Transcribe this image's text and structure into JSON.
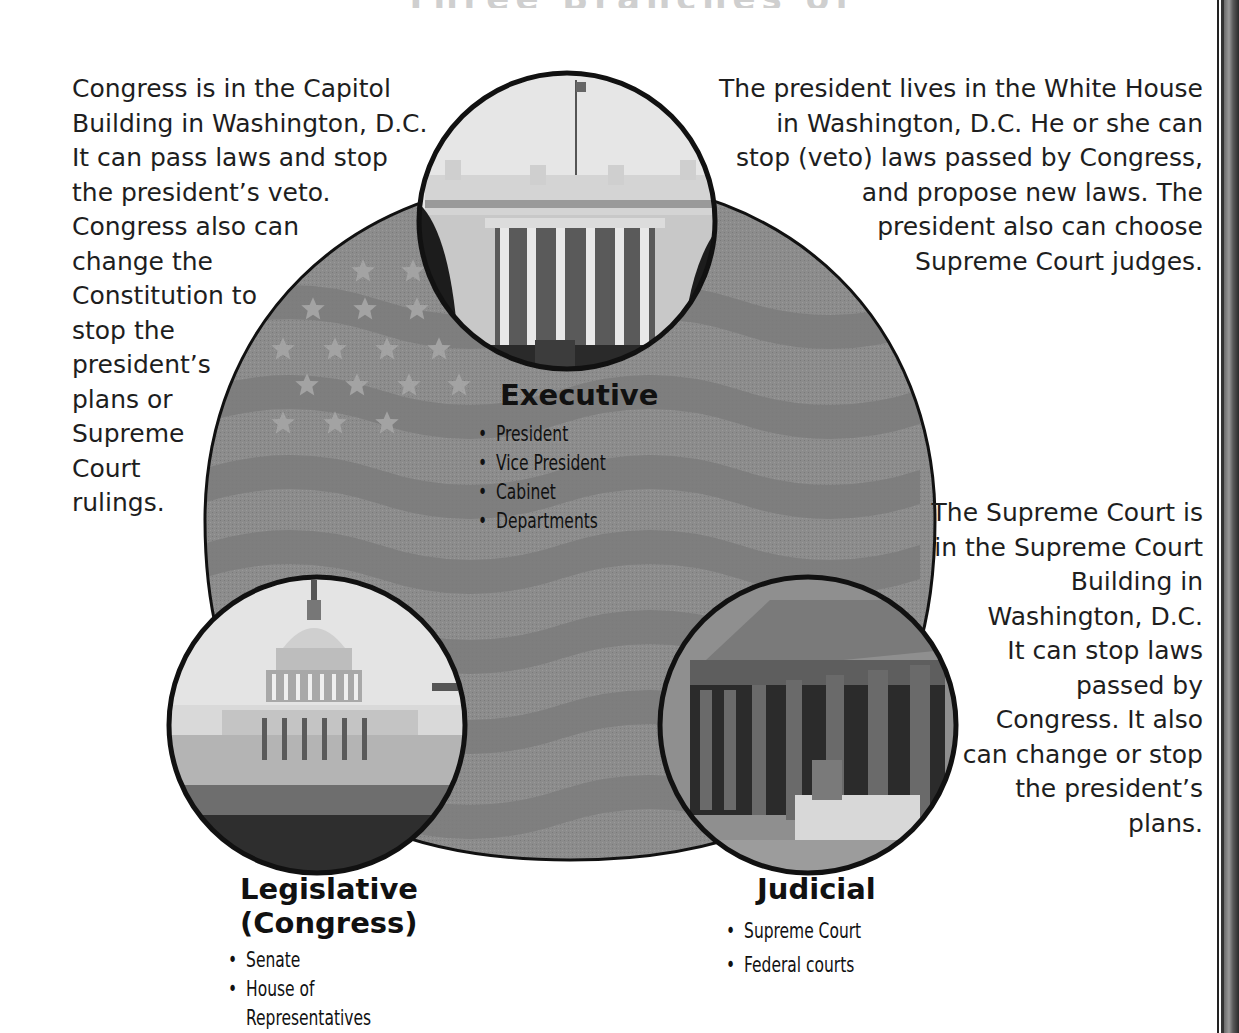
{
  "title_partial": "Three Branches of Government",
  "diagram": {
    "shape_fill": "#8a8a8a",
    "outline_color": "#111111",
    "executive": {
      "title": "Executive",
      "photo": "white-house-photo",
      "items": [
        "President",
        "Vice President",
        "Cabinet",
        "Departments"
      ]
    },
    "legislative": {
      "title_line1": "Legislative",
      "title_line2": "(Congress)",
      "photo": "capitol-building-photo",
      "items": [
        "Senate",
        "House of",
        "Representatives"
      ]
    },
    "judicial": {
      "title": "Judicial",
      "photo": "supreme-court-photo",
      "items": [
        "Supreme Court",
        "Federal courts"
      ]
    }
  },
  "descriptions": {
    "congress": [
      "Congress is in the Capitol",
      "Building in Washington, D.C.",
      "It can pass laws and stop",
      "the president’s veto.",
      "Congress also can",
      "change the",
      "Constitution to",
      "stop the",
      "president’s",
      "plans or",
      "Supreme",
      "Court",
      "rulings."
    ],
    "president": [
      "The president lives in the White House",
      "in Washington, D.C.  He or she can",
      "stop (veto) laws passed by Congress,",
      "and propose new laws.  The",
      "president also can choose",
      "Supreme Court judges."
    ],
    "supreme_court": [
      "The Supreme Court is",
      "in the Supreme Court",
      "Building in",
      "Washington, D.C.",
      "It can stop laws",
      "passed by",
      "Congress.  It also",
      "can change or stop",
      "the president’s",
      "plans."
    ]
  }
}
